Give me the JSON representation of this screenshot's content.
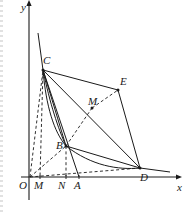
{
  "figure": {
    "background": "#ffffff",
    "stroke": "#1a1a1a",
    "width": 191,
    "height": 212
  },
  "axes": {
    "x_label": "x",
    "y_label": "y",
    "origin_label": "O",
    "x_axis": {
      "x1": 21,
      "y1": 177,
      "x2": 176,
      "y2": 177
    },
    "y_axis": {
      "x1": 29,
      "y1": 200,
      "x2": 29,
      "y2": 6
    }
  },
  "axis_marks": [
    {
      "label": "M",
      "x": 40,
      "y": 177
    },
    {
      "label": "N",
      "x": 66,
      "y": 177
    },
    {
      "label": "A",
      "x": 79,
      "y": 177
    }
  ],
  "points": [
    {
      "label": "C",
      "x": 43,
      "y": 70
    },
    {
      "label": "E",
      "x": 118,
      "y": 90
    },
    {
      "label": "M",
      "x": 92,
      "y": 108
    },
    {
      "label": "B",
      "x": 66,
      "y": 146
    },
    {
      "label": "D",
      "x": 140,
      "y": 168
    }
  ],
  "labels": [
    {
      "name": "label-y-axis",
      "text": "y",
      "x": 21,
      "y": 2
    },
    {
      "name": "label-x-axis",
      "text": "x",
      "x": 177,
      "y": 182
    },
    {
      "name": "label-origin",
      "text": "O",
      "x": 19,
      "y": 180
    },
    {
      "name": "label-M-axis",
      "text": "M",
      "x": 34,
      "y": 180
    },
    {
      "name": "label-N-axis",
      "text": "N",
      "x": 58,
      "y": 180
    },
    {
      "name": "label-A-axis",
      "text": "A",
      "x": 74,
      "y": 180
    },
    {
      "name": "label-C",
      "text": "C",
      "x": 43,
      "y": 55
    },
    {
      "name": "label-E",
      "text": "E",
      "x": 120,
      "y": 76
    },
    {
      "name": "label-M-mid",
      "text": "M",
      "x": 88,
      "y": 96
    },
    {
      "name": "label-B",
      "text": "B",
      "x": 56,
      "y": 140
    },
    {
      "name": "label-D",
      "text": "D",
      "x": 140,
      "y": 172
    }
  ],
  "solid_segments": [
    {
      "name": "segment-C-E",
      "x1": 43,
      "y1": 70,
      "x2": 118,
      "y2": 90
    },
    {
      "name": "segment-E-D",
      "x1": 118,
      "y1": 90,
      "x2": 140,
      "y2": 168
    },
    {
      "name": "segment-C-D",
      "x1": 43,
      "y1": 70,
      "x2": 140,
      "y2": 168
    },
    {
      "name": "segment-C-B",
      "x1": 43,
      "y1": 70,
      "x2": 66,
      "y2": 146
    },
    {
      "name": "segment-B-D",
      "x1": 66,
      "y1": 146,
      "x2": 140,
      "y2": 168
    },
    {
      "name": "segment-C-A",
      "x1": 43,
      "y1": 70,
      "x2": 79,
      "y2": 177
    },
    {
      "name": "segment-ray-top",
      "x1": 38,
      "y1": 33,
      "x2": 43,
      "y2": 70
    },
    {
      "name": "segment-D-tail",
      "x1": 140,
      "y1": 168,
      "x2": 170,
      "y2": 172
    }
  ],
  "dashed_segments": [
    {
      "name": "dash-O-C",
      "x1": 30,
      "y1": 177,
      "x2": 43,
      "y2": 70
    },
    {
      "name": "dash-C-M",
      "x1": 43,
      "y1": 70,
      "x2": 40,
      "y2": 177
    },
    {
      "name": "dash-B-N",
      "x1": 66,
      "y1": 146,
      "x2": 66,
      "y2": 177
    },
    {
      "name": "dash-O-B",
      "x1": 30,
      "y1": 177,
      "x2": 66,
      "y2": 146
    },
    {
      "name": "dash-O-D",
      "x1": 30,
      "y1": 177,
      "x2": 140,
      "y2": 168
    },
    {
      "name": "dash-M-E",
      "x1": 92,
      "y1": 108,
      "x2": 118,
      "y2": 90
    },
    {
      "name": "dash-B-M-E",
      "x1": 66,
      "y1": 146,
      "x2": 92,
      "y2": 108
    }
  ],
  "curves": [
    {
      "name": "curve-C-B-outer",
      "d": "M 43 70 C 50 104 58 128 66 146"
    },
    {
      "name": "curve-C-B-inner",
      "d": "M 43 70 C 46 106 54 132 66 146"
    },
    {
      "name": "curve-B-D",
      "d": "M 66 146 C 92 166 118 170 140 168"
    }
  ]
}
